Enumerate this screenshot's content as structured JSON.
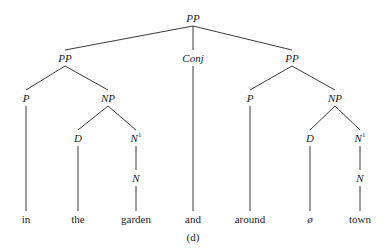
{
  "diagram": {
    "type": "syntax-tree",
    "caption": "(d)",
    "line_color": "#3a3a3a",
    "text_color": "#222222",
    "nodes": [
      {
        "id": "pp_root",
        "label": "PP",
        "sup": "",
        "kind": "category",
        "x": 193,
        "y": 18
      },
      {
        "id": "pp_left",
        "label": "PP",
        "sup": "",
        "kind": "category",
        "x": 65,
        "y": 58
      },
      {
        "id": "conj",
        "label": "Conj",
        "sup": "",
        "kind": "category",
        "x": 193,
        "y": 58
      },
      {
        "id": "pp_right",
        "label": "PP",
        "sup": "",
        "kind": "category",
        "x": 292,
        "y": 58
      },
      {
        "id": "p_left",
        "label": "P",
        "sup": "",
        "kind": "category",
        "x": 26,
        "y": 98
      },
      {
        "id": "np_left",
        "label": "NP",
        "sup": "",
        "kind": "category",
        "x": 108,
        "y": 98
      },
      {
        "id": "p_right",
        "label": "P",
        "sup": "",
        "kind": "category",
        "x": 250,
        "y": 98
      },
      {
        "id": "np_right",
        "label": "NP",
        "sup": "",
        "kind": "category",
        "x": 335,
        "y": 98
      },
      {
        "id": "d_left",
        "label": "D",
        "sup": "",
        "kind": "category",
        "x": 78,
        "y": 138
      },
      {
        "id": "nbar_left",
        "label": "N",
        "sup": "1",
        "kind": "category",
        "x": 136,
        "y": 138
      },
      {
        "id": "d_right",
        "label": "D",
        "sup": "",
        "kind": "category",
        "x": 310,
        "y": 138
      },
      {
        "id": "nbar_right",
        "label": "N",
        "sup": "1",
        "kind": "category",
        "x": 360,
        "y": 138
      },
      {
        "id": "n_left",
        "label": "N",
        "sup": "",
        "kind": "category",
        "x": 136,
        "y": 178
      },
      {
        "id": "n_right",
        "label": "N",
        "sup": "",
        "kind": "category",
        "x": 360,
        "y": 178
      },
      {
        "id": "w_in",
        "label": "in",
        "sup": "",
        "kind": "word",
        "x": 26,
        "y": 219
      },
      {
        "id": "w_the",
        "label": "the",
        "sup": "",
        "kind": "word",
        "x": 78,
        "y": 219
      },
      {
        "id": "w_garden",
        "label": "garden",
        "sup": "",
        "kind": "word",
        "x": 136,
        "y": 219
      },
      {
        "id": "w_and",
        "label": "and",
        "sup": "",
        "kind": "word",
        "x": 193,
        "y": 219
      },
      {
        "id": "w_around",
        "label": "around",
        "sup": "",
        "kind": "word",
        "x": 250,
        "y": 219
      },
      {
        "id": "w_null",
        "label": "ø",
        "sup": "",
        "kind": "word-italic",
        "x": 310,
        "y": 219
      },
      {
        "id": "w_town",
        "label": "town",
        "sup": "",
        "kind": "word",
        "x": 360,
        "y": 219
      }
    ],
    "edges": [
      [
        "pp_root",
        "pp_left"
      ],
      [
        "pp_root",
        "conj"
      ],
      [
        "pp_root",
        "pp_right"
      ],
      [
        "pp_left",
        "p_left"
      ],
      [
        "pp_left",
        "np_left"
      ],
      [
        "np_left",
        "d_left"
      ],
      [
        "np_left",
        "nbar_left"
      ],
      [
        "nbar_left",
        "n_left"
      ],
      [
        "p_left",
        "w_in"
      ],
      [
        "d_left",
        "w_the"
      ],
      [
        "n_left",
        "w_garden"
      ],
      [
        "conj",
        "w_and"
      ],
      [
        "pp_right",
        "p_right"
      ],
      [
        "pp_right",
        "np_right"
      ],
      [
        "np_right",
        "d_right"
      ],
      [
        "np_right",
        "nbar_right"
      ],
      [
        "nbar_right",
        "n_right"
      ],
      [
        "p_right",
        "w_around"
      ],
      [
        "d_right",
        "w_null"
      ],
      [
        "n_right",
        "w_town"
      ]
    ],
    "caption_pos": {
      "x": 193,
      "y": 237
    }
  }
}
